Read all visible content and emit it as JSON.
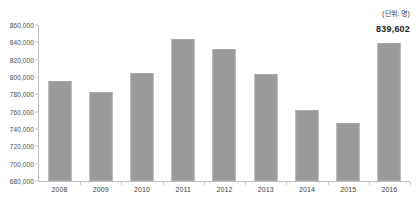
{
  "annotations": {
    "unit_label": "(단위: 명)",
    "highlight_value": "839,602"
  },
  "chart_data": {
    "type": "bar",
    "title": "",
    "subtitle": "",
    "xlabel": "",
    "ylabel": "",
    "categories": [
      "2008",
      "2009",
      "2010",
      "2011",
      "2012",
      "2013",
      "2014",
      "2015",
      "2016"
    ],
    "values": [
      795000,
      783000,
      805000,
      844000,
      832000,
      804000,
      762000,
      747000,
      839602
    ],
    "value_labels": [
      "",
      "",
      "",
      "",
      "",
      "",
      "",
      "",
      "839,602"
    ],
    "ylim": [
      680000,
      860000
    ],
    "ytick_values": [
      680000,
      700000,
      720000,
      740000,
      760000,
      780000,
      800000,
      820000,
      840000,
      860000
    ],
    "ytick_labels": [
      "680,000",
      "700,000",
      "720,000",
      "740,000",
      "760,000",
      "780,000",
      "800,000",
      "820,000",
      "840,000",
      "860,000"
    ],
    "grid": false,
    "legend": false,
    "unit_note": "(단위: 명)",
    "series_color": "#9a9a9a",
    "axis_color": "#bdbdbd",
    "background_color": "#ffffff"
  }
}
